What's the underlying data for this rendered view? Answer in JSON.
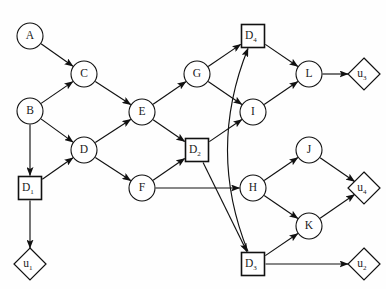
{
  "diagram": {
    "width": 386,
    "height": 289,
    "background_color": "#fefefe",
    "stroke_color": "#111111",
    "node_fill_color": "#ffffff",
    "shape_legend": {
      "circle": "chance-node",
      "square": "decision-node",
      "diamond": "utility-node"
    }
  },
  "nodes": [
    {
      "id": "A",
      "label": "A",
      "sub": "",
      "shape": "circle",
      "x": 30,
      "y": 36,
      "r": 13
    },
    {
      "id": "B",
      "label": "B",
      "sub": "",
      "shape": "circle",
      "x": 30,
      "y": 111,
      "r": 13
    },
    {
      "id": "C",
      "label": "C",
      "sub": "",
      "shape": "circle",
      "x": 84,
      "y": 74,
      "r": 13
    },
    {
      "id": "D",
      "label": "D",
      "sub": "",
      "shape": "circle",
      "x": 84,
      "y": 150,
      "r": 13
    },
    {
      "id": "E",
      "label": "E",
      "sub": "",
      "shape": "circle",
      "x": 142,
      "y": 112,
      "r": 13
    },
    {
      "id": "F",
      "label": "F",
      "sub": "",
      "shape": "circle",
      "x": 142,
      "y": 188,
      "r": 13
    },
    {
      "id": "G",
      "label": "G",
      "sub": "",
      "shape": "circle",
      "x": 197,
      "y": 74,
      "r": 13
    },
    {
      "id": "I",
      "label": "I",
      "sub": "",
      "shape": "circle",
      "x": 253,
      "y": 112,
      "r": 13
    },
    {
      "id": "H",
      "label": "H",
      "sub": "",
      "shape": "circle",
      "x": 253,
      "y": 188,
      "r": 13
    },
    {
      "id": "J",
      "label": "J",
      "sub": "",
      "shape": "circle",
      "x": 309,
      "y": 150,
      "r": 13
    },
    {
      "id": "K",
      "label": "K",
      "sub": "",
      "shape": "circle",
      "x": 309,
      "y": 226,
      "r": 13
    },
    {
      "id": "L",
      "label": "L",
      "sub": "",
      "shape": "circle",
      "x": 309,
      "y": 74,
      "r": 13
    },
    {
      "id": "D1",
      "label": "D",
      "sub": "1",
      "shape": "square",
      "x": 30,
      "y": 188,
      "r": 13
    },
    {
      "id": "D2",
      "label": "D",
      "sub": "2",
      "shape": "square",
      "x": 197,
      "y": 150,
      "r": 13
    },
    {
      "id": "D3",
      "label": "D",
      "sub": "3",
      "shape": "square",
      "x": 253,
      "y": 264,
      "r": 13
    },
    {
      "id": "D4",
      "label": "D",
      "sub": "4",
      "shape": "square",
      "x": 253,
      "y": 36,
      "r": 13
    },
    {
      "id": "U1",
      "label": "u",
      "sub": "1",
      "shape": "diamond",
      "x": 30,
      "y": 264,
      "r": 16
    },
    {
      "id": "U2",
      "label": "u",
      "sub": "2",
      "shape": "diamond",
      "x": 364,
      "y": 264,
      "r": 16
    },
    {
      "id": "U3",
      "label": "u",
      "sub": "3",
      "shape": "diamond",
      "x": 364,
      "y": 74,
      "r": 16
    },
    {
      "id": "U4",
      "label": "u",
      "sub": "4",
      "shape": "diamond",
      "x": 364,
      "y": 188,
      "r": 16
    }
  ],
  "edges": [
    {
      "from": "A",
      "to": "C",
      "curved": false
    },
    {
      "from": "B",
      "to": "C",
      "curved": false
    },
    {
      "from": "B",
      "to": "D",
      "curved": false
    },
    {
      "from": "B",
      "to": "D1",
      "curved": false
    },
    {
      "from": "C",
      "to": "E",
      "curved": false
    },
    {
      "from": "D1",
      "to": "D",
      "curved": false
    },
    {
      "from": "D1",
      "to": "U1",
      "curved": false
    },
    {
      "from": "D",
      "to": "E",
      "curved": false
    },
    {
      "from": "D",
      "to": "F",
      "curved": false
    },
    {
      "from": "E",
      "to": "G",
      "curved": false
    },
    {
      "from": "E",
      "to": "D2",
      "curved": false
    },
    {
      "from": "F",
      "to": "D2",
      "curved": false
    },
    {
      "from": "F",
      "to": "H",
      "curved": false
    },
    {
      "from": "G",
      "to": "D4",
      "curved": false
    },
    {
      "from": "G",
      "to": "I",
      "curved": false
    },
    {
      "from": "D2",
      "to": "I",
      "curved": false
    },
    {
      "from": "D2",
      "to": "D3",
      "curved": false
    },
    {
      "from": "D4",
      "to": "L",
      "curved": false
    },
    {
      "from": "I",
      "to": "L",
      "curved": false
    },
    {
      "from": "L",
      "to": "U3",
      "curved": false
    },
    {
      "from": "H",
      "to": "J",
      "curved": false
    },
    {
      "from": "H",
      "to": "K",
      "curved": false
    },
    {
      "from": "J",
      "to": "U4",
      "curved": false
    },
    {
      "from": "K",
      "to": "U4",
      "curved": false
    },
    {
      "from": "D3",
      "to": "K",
      "curved": false
    },
    {
      "from": "D3",
      "to": "U2",
      "curved": false
    },
    {
      "from": "D3",
      "to": "D4",
      "curved": true,
      "bow": -46
    }
  ]
}
